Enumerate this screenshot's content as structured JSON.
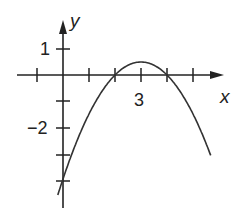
{
  "chart_data": {
    "type": "line",
    "title": "",
    "xlabel": "x",
    "ylabel": "y",
    "function": "y = -0.5(x-2)(x-4)",
    "tick_labels": {
      "x": [
        "3"
      ],
      "y": [
        "1",
        "-2"
      ]
    },
    "x_ticks": [
      -1,
      1,
      2,
      3,
      4,
      5
    ],
    "y_ticks": [
      1,
      -1,
      -2,
      -3,
      -4
    ],
    "xlim": [
      -1.5,
      6
    ],
    "ylim": [
      -5,
      2
    ],
    "grid": false,
    "series": [
      {
        "name": "parabola",
        "x": [
          -0.2,
          0,
          1,
          2,
          3,
          4,
          5,
          5.7
        ],
        "y": [
          -4.84,
          -4,
          -1.5,
          0,
          0.5,
          0,
          -1.5,
          -3.33
        ]
      }
    ],
    "annotations": {
      "x_intercepts": [
        2,
        4
      ],
      "vertex": [
        3,
        0.5
      ],
      "y_intercept": -4
    }
  },
  "labels": {
    "x_axis": "x",
    "y_axis": "y",
    "x_tick_3": "3",
    "y_tick_1": "1",
    "y_tick_neg2": "−2"
  },
  "colors": {
    "ink": "#222222",
    "curve": "#333333"
  }
}
